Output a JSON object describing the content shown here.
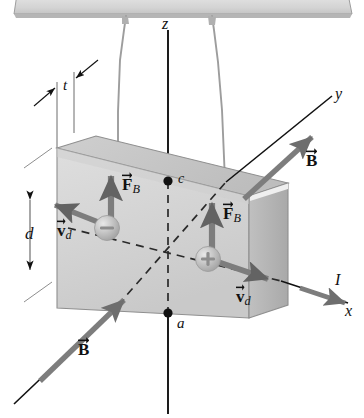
{
  "figure": {
    "background": "#ffffff"
  },
  "colors": {
    "slab_front": "#d6d6d6",
    "slab_top": "#c2c2c2",
    "slab_side": "#b4b4b4",
    "slab_edge": "#8a8a8a",
    "vector_gray": "#7d7d7d",
    "vector_gray_dark": "#6e6e6e",
    "axis_black": "#111111",
    "wire_gray": "#9a9a9a",
    "bar_fill": "#dadada",
    "charge_fill": "#bdbdbd",
    "label_color": "#111111"
  },
  "axes": {
    "z": {
      "label": "z"
    },
    "y": {
      "label": "y"
    },
    "x": {
      "label": "x"
    },
    "current": {
      "label": "I"
    }
  },
  "points": [
    {
      "name": "c",
      "label": "c"
    },
    {
      "name": "a",
      "label": "a"
    }
  ],
  "dimensions": [
    {
      "name": "thickness",
      "label": "t"
    },
    {
      "name": "depth",
      "label": "d"
    }
  ],
  "field_vectors": [
    {
      "name": "B-upper-right",
      "symbol": "B",
      "vector": true
    },
    {
      "name": "B-lower-left",
      "symbol": "B",
      "vector": true
    }
  ],
  "carriers": [
    {
      "name": "negative-carrier",
      "sign": "−",
      "force_label": {
        "symbol": "F",
        "subscript": "B",
        "vector": true
      },
      "drift_label": {
        "symbol": "v",
        "subscript": "d",
        "vector": true
      }
    },
    {
      "name": "positive-carrier",
      "sign": "+",
      "force_label": {
        "symbol": "F",
        "subscript": "B",
        "vector": true
      },
      "drift_label": {
        "symbol": "v",
        "subscript": "d",
        "vector": true
      }
    }
  ]
}
